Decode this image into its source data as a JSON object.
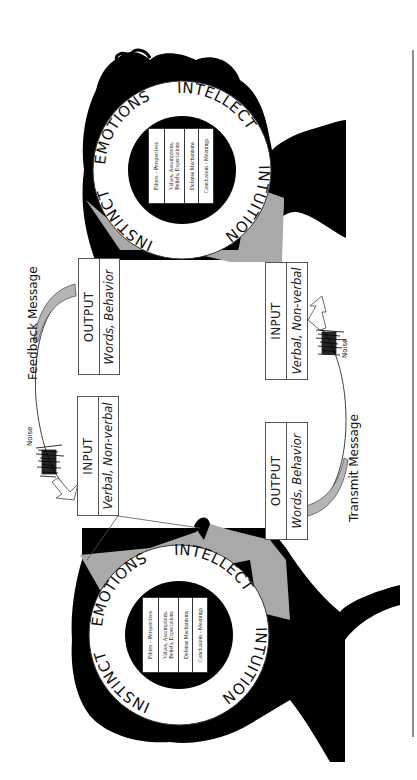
{
  "diagram": {
    "colors": {
      "silhouette": "#000000",
      "skin_gray": "#a9a9a9",
      "ring_white": "#ffffff",
      "line": "#555555"
    },
    "persons": [
      {
        "id": "top",
        "ring_labels": [
          "INSTINCT",
          "EMOTIONS",
          "INTELLECT",
          "INTUITION"
        ],
        "filters": [
          "Filters – Perspectives",
          "Values, Assumptions,\nBeliefs, Expectations",
          "Defense Mechanisms",
          "Conclusions - Meanings"
        ]
      },
      {
        "id": "bottom",
        "ring_labels": [
          "INSTINCT",
          "EMOTIONS",
          "INTELLECT",
          "INTUITION"
        ],
        "filters": [
          "Filters – Perspectives",
          "Values, Assumptions,\nBeliefs, Expectations",
          "Defense Mechanisms",
          "Conclusions - Meanings"
        ]
      }
    ],
    "boxes": {
      "left_output": {
        "title": "OUTPUT",
        "sub": "Words, Behavior"
      },
      "left_input": {
        "title": "INPUT",
        "sub": "Verbal, Non-verbal"
      },
      "right_input": {
        "title": "INPUT",
        "sub": "Verbal, Non-verbal"
      },
      "right_output": {
        "title": "OUTPUT",
        "sub": "Words, Behavior"
      }
    },
    "labels": {
      "feedback": "Feedback Message",
      "transmit": "Transmit Message",
      "noise_left": "Noise",
      "noise_right": "Noise"
    }
  }
}
